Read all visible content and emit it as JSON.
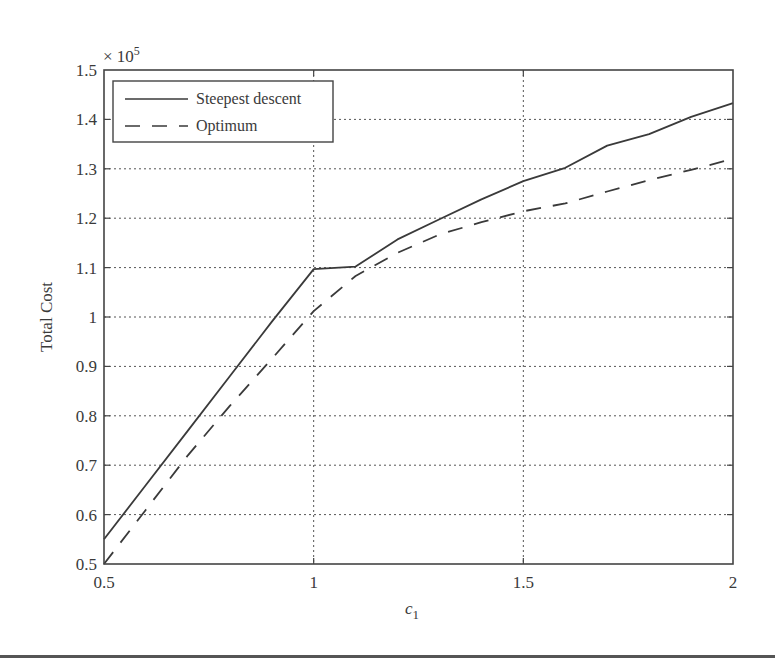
{
  "chart_data": {
    "type": "line",
    "title": "",
    "xlabel": "c1",
    "xlabel_main": "c",
    "xlabel_sub": "1",
    "ylabel": "Total Cost",
    "y_multiplier": "× 10",
    "y_multiplier_exp": "5",
    "xlim": [
      0.5,
      2
    ],
    "ylim": [
      0.5,
      1.5
    ],
    "x_ticks": [
      0.5,
      1,
      1.5,
      2
    ],
    "x_tick_labels": [
      "0.5",
      "1",
      "1.5",
      "2"
    ],
    "y_ticks": [
      0.5,
      0.6,
      0.7,
      0.8,
      0.9,
      1.0,
      1.1,
      1.2,
      1.3,
      1.4,
      1.5
    ],
    "y_tick_labels": [
      "0.5",
      "0.6",
      "0.7",
      "0.8",
      "0.9",
      "1",
      "1.1",
      "1.2",
      "1.3",
      "1.4",
      "1.5"
    ],
    "grid": true,
    "legend_position": "upper left",
    "x": [
      0.5,
      0.6,
      0.7,
      0.8,
      0.9,
      1.0,
      1.1,
      1.2,
      1.3,
      1.4,
      1.5,
      1.6,
      1.7,
      1.8,
      1.9,
      2.0
    ],
    "series": [
      {
        "name": "Steepest descent",
        "style": "solid",
        "values": [
          0.55,
          0.66,
          0.77,
          0.88,
          0.99,
          1.097,
          1.102,
          1.157,
          1.198,
          1.238,
          1.275,
          1.302,
          1.347,
          1.37,
          1.405,
          1.433
        ]
      },
      {
        "name": "Optimum",
        "style": "dashed",
        "values": [
          0.5,
          0.61,
          0.72,
          0.82,
          0.915,
          1.012,
          1.083,
          1.13,
          1.167,
          1.192,
          1.214,
          1.23,
          1.254,
          1.277,
          1.298,
          1.32
        ]
      }
    ]
  },
  "colors": {
    "line": "#3a3a3a",
    "grid": "#555555",
    "axis": "#444444"
  }
}
